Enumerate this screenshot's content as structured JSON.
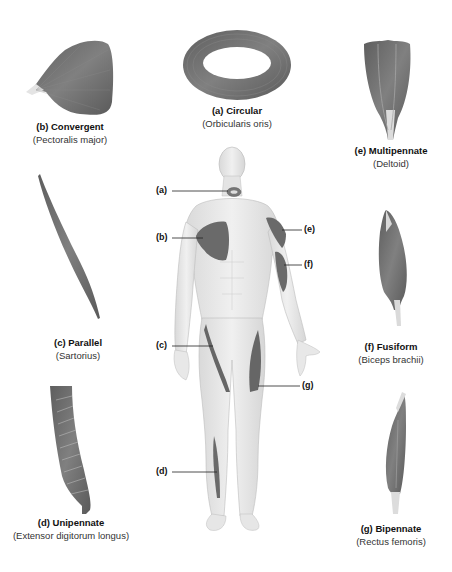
{
  "diagram": {
    "colors": {
      "muscle": "#6e6e6e",
      "muscle_dark": "#555555",
      "body": "#e6e6e6",
      "outline": "#b5b5b5",
      "tendon": "#d8d8d8",
      "text": "#111111"
    },
    "muscles": [
      {
        "letter": "(a)",
        "type": "Circular",
        "title": "(a) Circular",
        "example": "(Orbicularis oris)"
      },
      {
        "letter": "(b)",
        "type": "Convergent",
        "title": "(b) Convergent",
        "example": "(Pectoralis major)"
      },
      {
        "letter": "(c)",
        "type": "Parallel",
        "title": "(c) Parallel",
        "example": "(Sartorius)"
      },
      {
        "letter": "(d)",
        "type": "Unipennate",
        "title": "(d) Unipennate",
        "example": "(Extensor digitorum longus)"
      },
      {
        "letter": "(e)",
        "type": "Multipennate",
        "title": "(e) Multipennate",
        "example": "(Deltoid)"
      },
      {
        "letter": "(f)",
        "type": "Fusiform",
        "title": "(f) Fusiform",
        "example": "(Biceps brachii)"
      },
      {
        "letter": "(g)",
        "type": "Bipennate",
        "title": "(g) Bipennate",
        "example": "(Rectus femoris)"
      }
    ],
    "callouts": [
      "(a)",
      "(b)",
      "(c)",
      "(d)",
      "(e)",
      "(f)",
      "(g)"
    ]
  }
}
